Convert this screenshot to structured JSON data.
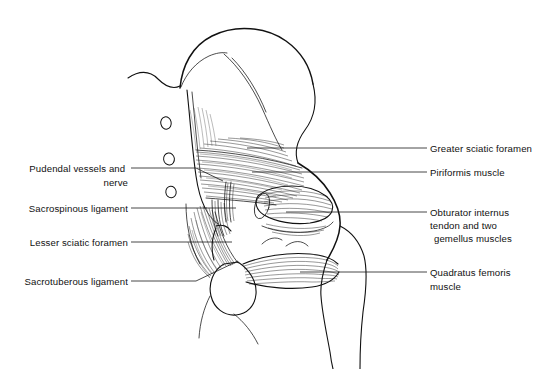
{
  "figure": {
    "background_color": "#ffffff",
    "ink_color": "#111111",
    "width": 550,
    "height": 369
  },
  "labels_left": [
    {
      "id": "pudendal",
      "name": "pudendal-vessels-and-nerve",
      "lines": [
        "Pudendal vessels and",
        "nerve"
      ],
      "text_x": 128,
      "text_y": 172,
      "line_height": 14,
      "leader": "M 131 168 L 196 168 L 223 181"
    },
    {
      "id": "sacrospinous",
      "name": "sacrospinous-ligament",
      "lines": [
        "Sacrospinous ligament"
      ],
      "text_x": 128,
      "text_y": 212,
      "line_height": 14,
      "leader": "M 131 208 L 236 208"
    },
    {
      "id": "lesser-sciatic-foramen",
      "name": "lesser-sciatic-foramen",
      "lines": [
        "Lesser sciatic foramen"
      ],
      "text_x": 128,
      "text_y": 246,
      "line_height": 14,
      "leader": "M 131 242 L 232 242"
    },
    {
      "id": "sacrotuberous",
      "name": "sacrotuberous-ligament",
      "lines": [
        "Sacrotuberous ligament"
      ],
      "text_x": 128,
      "text_y": 285,
      "line_height": 14,
      "leader": "M 131 281 L 196 281 L 238 261"
    }
  ],
  "labels_right": [
    {
      "id": "greater-sciatic-foramen",
      "name": "greater-sciatic-foramen",
      "lines": [
        "Greater sciatic foramen"
      ],
      "text_x": 430,
      "text_y": 152,
      "line_height": 14,
      "leader": "M 427 148 L 247 148"
    },
    {
      "id": "piriformis",
      "name": "piriformis-muscle",
      "lines": [
        "Piriformis muscle"
      ],
      "text_x": 430,
      "text_y": 176,
      "line_height": 14,
      "leader": "M 427 172 L 252 172"
    },
    {
      "id": "obturator-internus",
      "name": "obturator-internus-tendon-and-gemelli",
      "lines": [
        "Obturator internus",
        "tendon and two",
        "gemellus muscles"
      ],
      "text_x": 430,
      "text_y": 216,
      "line_height": 13,
      "leader": "M 427 212 L 286 212"
    },
    {
      "id": "quadratus-femoris",
      "name": "quadratus-femoris-muscle",
      "lines": [
        "Quadratus femoris",
        "muscle"
      ],
      "text_x": 430,
      "text_y": 276,
      "line_height": 14,
      "leader": "M 427 272 L 300 272"
    }
  ],
  "anatomy": {
    "sacral_foramina": [
      {
        "name": "sacral-foramen-1",
        "cx": 166,
        "cy": 123,
        "rx": 5.2,
        "ry": 6.2,
        "rot": -12
      },
      {
        "name": "sacral-foramen-2",
        "cx": 169,
        "cy": 159,
        "rx": 5.4,
        "ry": 6.0,
        "rot": -8
      },
      {
        "name": "sacral-foramen-3",
        "cx": 171,
        "cy": 192,
        "rx": 5.2,
        "ry": 5.8,
        "rot": -6
      }
    ],
    "structures": [
      {
        "name": "iliac-crest",
        "note": "superior curved ilium border"
      },
      {
        "name": "sacrum",
        "note": "medial plate bearing foramina"
      },
      {
        "name": "ilium-body",
        "note": "large posterior ilium mass"
      },
      {
        "name": "piriformis-muscle-belly",
        "note": "wide striated band from sacrum to greater trochanter"
      },
      {
        "name": "obturator-internus-tendon",
        "note": "cylindrical tendon with gemelli"
      },
      {
        "name": "quadratus-femoris-muscle-belly",
        "note": "horizontal striated band to femur"
      },
      {
        "name": "sacrotuberous-ligament-fan",
        "note": "fan of fibers to ischial tuberosity"
      },
      {
        "name": "sacrospinous-ligament-band",
        "note": "narrow vertical fiber bundle"
      },
      {
        "name": "greater-trochanter",
        "note": "lateral femoral prominence"
      },
      {
        "name": "femoral-shaft",
        "note": "descends to lower right"
      },
      {
        "name": "ischial-tuberosity",
        "note": "rounded inferior prominence"
      }
    ]
  }
}
